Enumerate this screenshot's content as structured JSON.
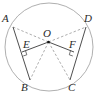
{
  "diagram": {
    "type": "geometry",
    "circle": {
      "cx": 49,
      "cy": 47,
      "r": 44,
      "stroke": "#9a9a9a"
    },
    "center": {
      "label": "O",
      "x": 48.5,
      "y": 42,
      "label_x": 43,
      "label_y": 37
    },
    "points": [
      {
        "label": "A",
        "x": 13,
        "y": 27,
        "label_x": 2,
        "label_y": 22
      },
      {
        "label": "B",
        "x": 30,
        "y": 80,
        "label_x": 21,
        "label_y": 91
      },
      {
        "label": "C",
        "x": 70,
        "y": 80,
        "label_x": 68,
        "label_y": 91
      },
      {
        "label": "D",
        "x": 86,
        "y": 27,
        "label_x": 84,
        "label_y": 22
      },
      {
        "label": "E",
        "x": 22,
        "y": 52,
        "label_x": 23,
        "label_y": 48
      },
      {
        "label": "F",
        "x": 74,
        "y": 52,
        "label_x": 69,
        "label_y": 48
      }
    ],
    "solid_segments": [
      "AB",
      "DC",
      "OE",
      "OF"
    ],
    "dashed_segments": [
      "OA",
      "OD",
      "OB",
      "OC"
    ],
    "right_angles": [
      "E",
      "F"
    ],
    "colors": {
      "line": "#3a3a3a",
      "dashed": "#8a8a8a",
      "label": "#2a2a2a"
    }
  }
}
